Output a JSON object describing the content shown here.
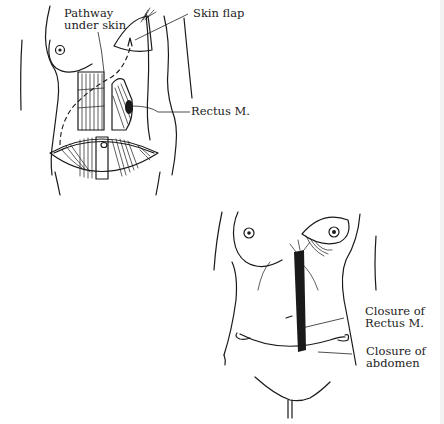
{
  "figure": {
    "background": "#ffffff",
    "ink_color": "#1a1a1a"
  },
  "top_figure": {
    "labels": {
      "pathway": "Pathway\nunder skin",
      "skin_flap": "Skin flap",
      "rectus": "Rectus M."
    }
  },
  "bottom_figure": {
    "labels": {
      "closure_rectus": "Closure of\nRectus M.",
      "closure_abdomen": "Closure of\nabdomen"
    }
  }
}
